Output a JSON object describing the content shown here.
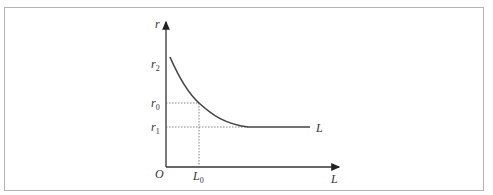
{
  "diagram": {
    "axes": {
      "y_label": "r",
      "x_label": "L",
      "origin_label": "O"
    },
    "y_ticks": [
      {
        "label": "r",
        "sub": "2",
        "y": 64
      },
      {
        "label": "r",
        "sub": "0",
        "y": 103
      },
      {
        "label": "r",
        "sub": "1",
        "y": 127
      }
    ],
    "x_ticks": [
      {
        "label": "L",
        "sub": "0",
        "x": 199
      }
    ],
    "curve_label": "L",
    "colors": {
      "axis": "#333333",
      "curve": "#444444",
      "guide": "#666666",
      "frame": "#b4b4b4"
    }
  }
}
